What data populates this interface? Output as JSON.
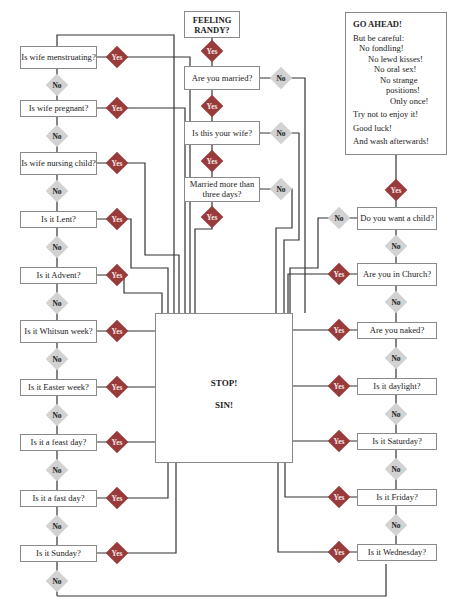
{
  "start": {
    "label": "FEELING RANDY?"
  },
  "center_questions": [
    {
      "label": "Are you married?",
      "yes": "Yes",
      "no": "No"
    },
    {
      "label": "Is this your wife?",
      "yes": "Yes",
      "no": "No"
    },
    {
      "label": "Married more than three days?",
      "yes": "Yes",
      "no": "No"
    }
  ],
  "start_yes": "Yes",
  "left_questions": [
    {
      "label": "Is wife menstruating?",
      "yes": "Yes",
      "no": "No"
    },
    {
      "label": "Is wife pregnant?",
      "yes": "Yes",
      "no": "No"
    },
    {
      "label": "Is wife nursing child?",
      "yes": "Yes",
      "no": "No"
    },
    {
      "label": "Is it Lent?",
      "yes": "Yes",
      "no": "No"
    },
    {
      "label": "Is it Advent?",
      "yes": "Yes",
      "no": "No"
    },
    {
      "label": "Is it Whitsun week?",
      "yes": "Yes",
      "no": "No"
    },
    {
      "label": "Is it Easter week?",
      "yes": "Yes",
      "no": "No"
    },
    {
      "label": "Is it a feast day?",
      "yes": "Yes",
      "no": "No"
    },
    {
      "label": "Is it a fast day?",
      "yes": "Yes",
      "no": "No"
    },
    {
      "label": "Is it Sunday?",
      "yes": "Yes",
      "no": "No"
    }
  ],
  "right_questions": [
    {
      "label": "Do you want a child?",
      "yes": "Yes",
      "no": "No"
    },
    {
      "label": "Are you in Church?",
      "yes": "Yes",
      "no": "No"
    },
    {
      "label": "Are you naked?",
      "yes": "Yes",
      "no": "No"
    },
    {
      "label": "Is it daylight?",
      "yes": "Yes",
      "no": "No"
    },
    {
      "label": "Is it Saturday?",
      "yes": "Yes",
      "no": "No"
    },
    {
      "label": "Is it Friday?",
      "yes": "Yes",
      "no": "No"
    },
    {
      "label": "Is it Wednesday?",
      "yes": "Yes"
    }
  ],
  "go_ahead": {
    "title": "GO AHEAD!",
    "lines": [
      "But be careful:",
      "No fondling!",
      "No lewd kisses!",
      "No oral sex!",
      "No strange",
      "positions!",
      "Only once!",
      "Try not to enjoy it!",
      "Good luck!",
      "And wash afterwards!"
    ]
  },
  "stop": {
    "line1": "STOP!",
    "line2": "SIN!"
  },
  "colors": {
    "yes": "#9a3b3b",
    "no": "#d2d2d2",
    "line": "#333333",
    "border": "#8a8a8a"
  }
}
